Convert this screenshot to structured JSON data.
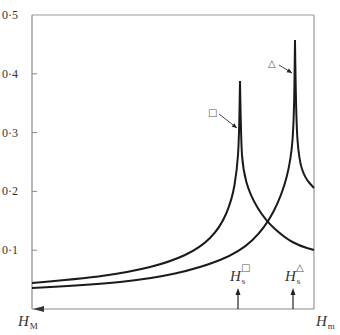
{
  "chart_data": {
    "type": "line",
    "title": "",
    "xlabel_left": "H_M",
    "xlabel_right": "H_m",
    "ylabel": "",
    "ylim": [
      0,
      0.5
    ],
    "yticks": [
      {
        "value": 0.1,
        "label": "0·1"
      },
      {
        "value": 0.2,
        "label": "0·2"
      },
      {
        "value": 0.3,
        "label": "0·3"
      },
      {
        "value": 0.4,
        "label": "0·4"
      },
      {
        "value": 0.5,
        "label": "0·5"
      }
    ],
    "x_axis": {
      "left_label": {
        "main": "H",
        "sub": "M"
      },
      "right_label": {
        "main": "H",
        "sub": "m"
      },
      "arrow_direction": "left"
    },
    "grid": false,
    "series": [
      {
        "name": "□",
        "marker": "square",
        "peak_x_frac": 0.734,
        "peak_value": 0.39,
        "points_px": [
          [
            32,
            283
          ],
          [
            80,
            279
          ],
          [
            130,
            272
          ],
          [
            170,
            262
          ],
          [
            200,
            248
          ],
          [
            220,
            228
          ],
          [
            232,
            200
          ],
          [
            237,
            170
          ],
          [
            239,
            140
          ],
          [
            240,
            81
          ],
          [
            241,
            140
          ],
          [
            243,
            170
          ],
          [
            250,
            195
          ],
          [
            265,
            220
          ],
          [
            285,
            238
          ],
          [
            300,
            246
          ],
          [
            314,
            250
          ]
        ],
        "values_approx": {
          "start": 0.045,
          "peak": 0.39,
          "end": 0.1
        }
      },
      {
        "name": "△",
        "marker": "triangle",
        "peak_x_frac": 0.933,
        "peak_value": 0.46,
        "points_px": [
          [
            32,
            288
          ],
          [
            90,
            285
          ],
          [
            150,
            279
          ],
          [
            200,
            268
          ],
          [
            240,
            252
          ],
          [
            265,
            228
          ],
          [
            282,
            195
          ],
          [
            291,
            160
          ],
          [
            294,
            120
          ],
          [
            295,
            40
          ],
          [
            296,
            120
          ],
          [
            299,
            160
          ],
          [
            305,
            178
          ],
          [
            314,
            188
          ]
        ],
        "values_approx": {
          "start": 0.036,
          "peak": 0.46,
          "end": 0.205
        }
      }
    ],
    "annotations": [
      {
        "symbol": "□",
        "x": 213,
        "y": 112,
        "arrow_to": [
          237,
          128
        ]
      },
      {
        "symbol": "△",
        "x": 273,
        "y": 63,
        "arrow_to": [
          292,
          73
        ]
      },
      {
        "label_main": "H",
        "label_sub": "s",
        "label_sup": "□",
        "arrow_x": 238
      },
      {
        "label_main": "H",
        "label_sub": "s",
        "label_sup": "△",
        "arrow_x": 293
      }
    ]
  },
  "colors": {
    "axis": "#888888",
    "curve": "#1a1a1a",
    "text": "#333333"
  }
}
